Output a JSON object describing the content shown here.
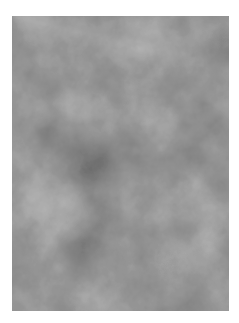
{
  "image": {
    "description": "Grayscale cloud / Perlin noise texture",
    "colors": {
      "background": "#ffffff",
      "dark": "#1e1e1e",
      "mid": "#4a4a4a",
      "light": "#8a8a8a"
    }
  }
}
